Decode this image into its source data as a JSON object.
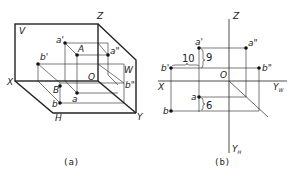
{
  "figure_a": {
    "caption": "(a)",
    "planes": {
      "V": "V",
      "W": "W",
      "H": "H"
    },
    "axes": {
      "X": "X",
      "Y": "Y",
      "Z": "Z",
      "O": "O"
    },
    "points": {
      "a_prime": "a'",
      "a_double_prime": "a\"",
      "A": "A",
      "a": "a",
      "b_prime": "b'",
      "b_double_prime": "b\"",
      "B": "B",
      "b": "b"
    }
  },
  "figure_b": {
    "caption": "(b)",
    "axes": {
      "X": "X",
      "Z": "Z",
      "O": "O",
      "YW": "Y",
      "YW_sub": "W",
      "YH": "Y",
      "YH_sub": "H"
    },
    "points": {
      "a_prime": "a'",
      "a_double_prime": "a\"",
      "a": "a",
      "b_prime": "b'",
      "b_double_prime": "b\"",
      "b": "b"
    },
    "dimensions": {
      "horizontal": "10",
      "vertical_top": "9",
      "vertical_bottom": "6"
    }
  }
}
